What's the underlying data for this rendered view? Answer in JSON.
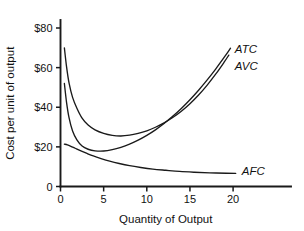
{
  "chart_data": {
    "type": "line",
    "title": "",
    "xlabel": "Quantity of Output",
    "ylabel": "Cost per unit of output",
    "xlim": [
      0,
      27
    ],
    "ylim": [
      0,
      88
    ],
    "grid": false,
    "legend_position": "inline-right-of-curve-ends",
    "x_ticks": [
      0,
      5,
      10,
      15,
      20
    ],
    "x_tick_labels": [
      "0",
      "5",
      "10",
      "15",
      "20"
    ],
    "y_ticks": [
      0,
      20,
      40,
      60,
      80
    ],
    "y_tick_labels": [
      "0",
      "$20",
      "$40",
      "$60",
      "$80"
    ],
    "series": [
      {
        "name": "ATC",
        "label": "ATC",
        "color": "#1a1a1a",
        "x": [
          0.45,
          0.7,
          1.0,
          1.4,
          1.9,
          2.5,
          3.2,
          4.0,
          5.0,
          6.0,
          7.0,
          8.0,
          9.0,
          10.0,
          11.0,
          12.0,
          13.0,
          14.0,
          15.0,
          16.0,
          17.0,
          18.0,
          19.0,
          19.5
        ],
        "y": [
          70.0,
          60.5,
          52.0,
          45.0,
          39.5,
          34.5,
          31.0,
          28.6,
          26.8,
          25.8,
          25.5,
          25.9,
          26.8,
          28.1,
          29.9,
          32.1,
          34.8,
          38.0,
          41.8,
          46.2,
          51.2,
          56.8,
          63.0,
          66.3
        ]
      },
      {
        "name": "AVC",
        "label": "AVC",
        "color": "#1a1a1a",
        "x": [
          0.45,
          0.7,
          1.0,
          1.4,
          1.9,
          2.5,
          3.2,
          4.0,
          5.0,
          6.0,
          7.0,
          8.0,
          9.0,
          10.0,
          11.0,
          12.0,
          13.0,
          14.0,
          15.0,
          16.0,
          17.0,
          18.0,
          19.0,
          19.7
        ],
        "y": [
          52.0,
          42.5,
          34.5,
          28.0,
          23.5,
          20.4,
          18.8,
          18.0,
          17.9,
          18.6,
          19.8,
          21.4,
          23.4,
          25.8,
          28.6,
          31.8,
          35.4,
          39.4,
          43.8,
          48.6,
          53.8,
          59.4,
          65.4,
          69.8
        ]
      },
      {
        "name": "AFC",
        "label": "AFC",
        "color": "#1a1a1a",
        "x": [
          0.45,
          0.8,
          1.2,
          1.7,
          2.3,
          3.0,
          3.8,
          4.7,
          5.7,
          6.8,
          8.0,
          9.3,
          10.7,
          12.2,
          13.8,
          15.5,
          17.3,
          19.2,
          20.3
        ],
        "y": [
          21.4,
          21.0,
          20.3,
          19.3,
          18.1,
          16.8,
          15.4,
          14.1,
          12.8,
          11.6,
          10.5,
          9.6,
          8.8,
          8.2,
          7.6,
          7.2,
          6.9,
          6.7,
          6.6
        ]
      }
    ],
    "annotations": [
      {
        "text": "ATC",
        "x": 20.2,
        "y": 69.5
      },
      {
        "text": "AVC",
        "x": 20.2,
        "y": 61.0
      },
      {
        "text": "AFC",
        "x": 21.0,
        "y": 8.0
      }
    ],
    "colors": {
      "ink": "#1a1a1a",
      "background": "#ffffff"
    }
  }
}
